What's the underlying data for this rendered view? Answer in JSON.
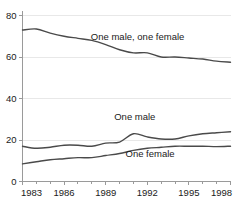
{
  "chart_data": {
    "type": "line",
    "title": "",
    "subtitle": "",
    "xlabel": "",
    "ylabel": "",
    "xlim": [
      1983,
      1998
    ],
    "ylim": [
      0,
      80
    ],
    "grid": true,
    "legend_position": "inline-labels",
    "x": [
      1983,
      1984,
      1985,
      1986,
      1987,
      1988,
      1989,
      1990,
      1991,
      1992,
      1993,
      1994,
      1995,
      1996,
      1997,
      1998
    ],
    "y_ticks": [
      0,
      20,
      40,
      60,
      80
    ],
    "y_tick_labels": [
      "0",
      "20",
      "40",
      "60",
      "80"
    ],
    "x_ticks": [
      1983,
      1986,
      1989,
      1992,
      1995,
      1998
    ],
    "x_tick_labels": [
      "1983",
      "1986",
      "1989",
      "1992",
      "1995",
      "1998"
    ],
    "x_minor_ticks": [
      1984,
      1985,
      1987,
      1988,
      1990,
      1991,
      1993,
      1994,
      1996,
      1997
    ],
    "series": [
      {
        "name": "One male, one female",
        "label": "One male, one female",
        "values": [
          73,
          73.5,
          71.5,
          70,
          69,
          68,
          66,
          63.5,
          62,
          62,
          60,
          60,
          59.5,
          59,
          58,
          57.5
        ],
        "label_x": 1991.3,
        "label_y": 68,
        "color": "#4a4a4a"
      },
      {
        "name": "One male",
        "label": "One male",
        "values": [
          17,
          16,
          16.5,
          17.5,
          17.5,
          17,
          18.5,
          19,
          23,
          21.5,
          20.5,
          20.5,
          22,
          23,
          23.5,
          24
        ],
        "label_x": 1991.1,
        "label_y": 29.5,
        "color": "#4a4a4a"
      },
      {
        "name": "One female",
        "label": "One female",
        "values": [
          8.5,
          9.5,
          10.5,
          11,
          11.5,
          11.5,
          12.5,
          13.5,
          15,
          16,
          16.5,
          17,
          17,
          17,
          16.8,
          17
        ],
        "label_x": 1992.2,
        "label_y": 12,
        "color": "#4a4a4a"
      }
    ]
  }
}
